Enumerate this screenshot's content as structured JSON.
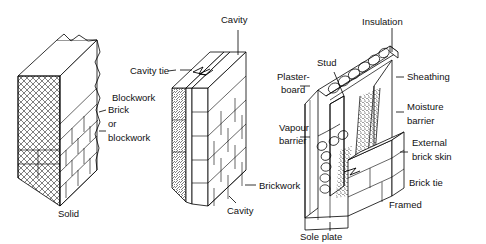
{
  "figure": {
    "type": "technical-illustration",
    "background_color": "#ffffff",
    "line_color": "#000000"
  },
  "panels": [
    {
      "id": "solid",
      "caption": "Solid",
      "labels": [
        {
          "id": "brick-or-blockwork",
          "lines": [
            "Brick",
            "or",
            "blockwork"
          ]
        }
      ]
    },
    {
      "id": "cavity",
      "caption": "Cavity",
      "labels": [
        {
          "id": "cavity-top",
          "lines": [
            "Cavity"
          ]
        },
        {
          "id": "cavity-tie",
          "lines": [
            "Cavity tie"
          ]
        },
        {
          "id": "blockwork",
          "lines": [
            "Blockwork"
          ]
        },
        {
          "id": "brickwork",
          "lines": [
            "Brickwork"
          ]
        },
        {
          "id": "cavity-bottom",
          "lines": [
            "Cavity"
          ]
        }
      ]
    },
    {
      "id": "framed",
      "caption": "Framed",
      "labels": [
        {
          "id": "insulation",
          "lines": [
            "Insulation"
          ]
        },
        {
          "id": "stud",
          "lines": [
            "Stud"
          ]
        },
        {
          "id": "plasterboard",
          "lines": [
            "Plaster-",
            "board"
          ]
        },
        {
          "id": "vapour-barrier",
          "lines": [
            "Vapour",
            "barrier"
          ]
        },
        {
          "id": "sheathing",
          "lines": [
            "Sheathing"
          ]
        },
        {
          "id": "moisture-barrier",
          "lines": [
            "Moisture",
            "barrier"
          ]
        },
        {
          "id": "external-brick-skin",
          "lines": [
            "External",
            "brick skin"
          ]
        },
        {
          "id": "brick-tie",
          "lines": [
            "Brick tie"
          ]
        },
        {
          "id": "sole-plate",
          "lines": [
            "Sole plate"
          ]
        }
      ]
    }
  ],
  "text": {
    "solid_caption": "Solid",
    "solid_brick_l1": "Brick",
    "solid_brick_l2": "or",
    "solid_brick_l3": "blockwork",
    "cavity_top": "Cavity",
    "cavity_tie": "Cavity tie",
    "blockwork": "Blockwork",
    "brickwork": "Brickwork",
    "cavity_bottom": "Cavity",
    "insulation": "Insulation",
    "stud": "Stud",
    "plaster_l1": "Plaster-",
    "plaster_l2": "board",
    "vapour_l1": "Vapour",
    "vapour_l2": "barrier",
    "sheathing": "Sheathing",
    "moisture_l1": "Moisture",
    "moisture_l2": "barrier",
    "external_l1": "External",
    "external_l2": "brick skin",
    "brick_tie": "Brick tie",
    "framed_caption": "Framed",
    "sole_plate": "Sole plate"
  }
}
